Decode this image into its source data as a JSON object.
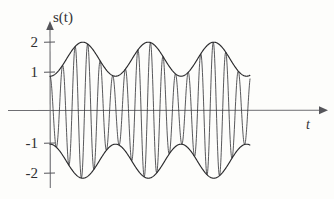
{
  "figure": {
    "title": "",
    "background_color": "#fdfdfb",
    "curve_color": "#2a2a2c",
    "axis_color": "#6e6e72"
  },
  "axes": {
    "y_axis_label": "s(t)",
    "x_axis_label": "t",
    "y_tick_labels": [
      "2",
      "1",
      "-1",
      "-2"
    ],
    "x_tick_labels": []
  },
  "chart_data": {
    "type": "line",
    "title": "",
    "xlabel": "t",
    "ylabel": "s(t)",
    "xlim": [
      0,
      13.8
    ],
    "ylim": [
      -2.2,
      2.2
    ],
    "grid": false,
    "legend": null,
    "y_ticks": [
      2,
      1,
      -1,
      -2
    ],
    "y_tick_labels": [
      "2",
      "1",
      "-1",
      "-2"
    ],
    "x_ticks": [],
    "series": [
      {
        "name": "upper-envelope",
        "formula": "1.5 + 0.5*cos(2*pi*t/3.6 + pi)",
        "envelope_min": 1,
        "envelope_max": 2,
        "peak_t_values": [
          1.8,
          5.4,
          9.0
        ],
        "trough_t_values": [
          0.0,
          3.6,
          7.2,
          10.8
        ]
      },
      {
        "name": "lower-envelope",
        "formula": "-(1.5 + 0.5*cos(2*pi*t/3.6 + pi))",
        "envelope_min": -2,
        "envelope_max": -1,
        "peak_t_values": [
          1.8,
          5.4,
          9.0
        ],
        "trough_t_values": [
          0.0,
          3.6,
          7.2,
          10.8
        ]
      },
      {
        "name": "carrier-modulated-signal",
        "formula": "(1.5 + 0.5*cos(2*pi*t/3.6 + pi)) * cos(2*pi*t/0.69)",
        "carrier_period": 0.69,
        "envelope_period": 3.6
      }
    ]
  }
}
